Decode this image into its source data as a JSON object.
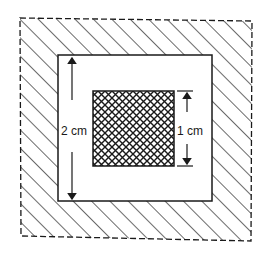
{
  "diagram": {
    "colors": {
      "line": "#1a1a1a",
      "background": "#ffffff"
    },
    "outer_region": {
      "border_style": "dashed",
      "fill": "diagonal-hatch"
    },
    "middle_square": {
      "fill": "white"
    },
    "inner_square": {
      "fill": "cross-hatch"
    },
    "dimensions": [
      {
        "id": "middle",
        "label": "2 cm"
      },
      {
        "id": "inner",
        "label": "1 cm"
      }
    ]
  }
}
